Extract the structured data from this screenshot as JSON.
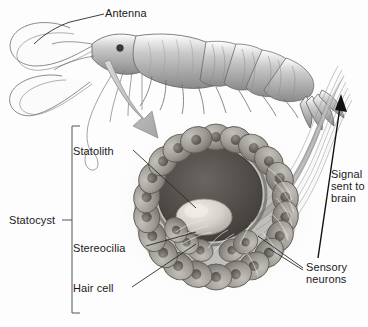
{
  "figure": {
    "background_color": "#fdfdfd",
    "text_color": "#1a1a1a"
  },
  "labels": {
    "antenna": "Antenna",
    "statolith": "Statolith",
    "statocyst": "Statocyst",
    "stereocilia": "Stereocilia",
    "hair_cell": "Hair cell",
    "signal_sent_to_brain": "Signal\nsent to\nbrain",
    "sensory_neurons": "Sensory\nneurons"
  },
  "illustration": {
    "shrimp": {
      "name": "shrimp-illustration",
      "body_color": "#9a9a9a",
      "outline_color": "#4a4a4a"
    },
    "flow_arrow": {
      "name": "flow-arrow",
      "color": "#b4b4b4",
      "outline": "#8c8c8c",
      "direction": "down-right"
    },
    "statocyst_organ": {
      "name": "statocyst-organ",
      "cavity_color": "#4e4a46",
      "cell_color": "#9b9791",
      "cell_nucleus_color": "#6a6761",
      "statolith_color": "#d8d4cd",
      "cell_count": 22
    },
    "nerve_bundle": {
      "name": "nerve-bundle",
      "color": "#a8a8a8"
    },
    "signal_arrow": {
      "name": "signal-arrow",
      "color": "#111111",
      "direction": "up"
    },
    "statocyst_bracket": {
      "name": "statocyst-bracket",
      "color": "#555555"
    }
  }
}
